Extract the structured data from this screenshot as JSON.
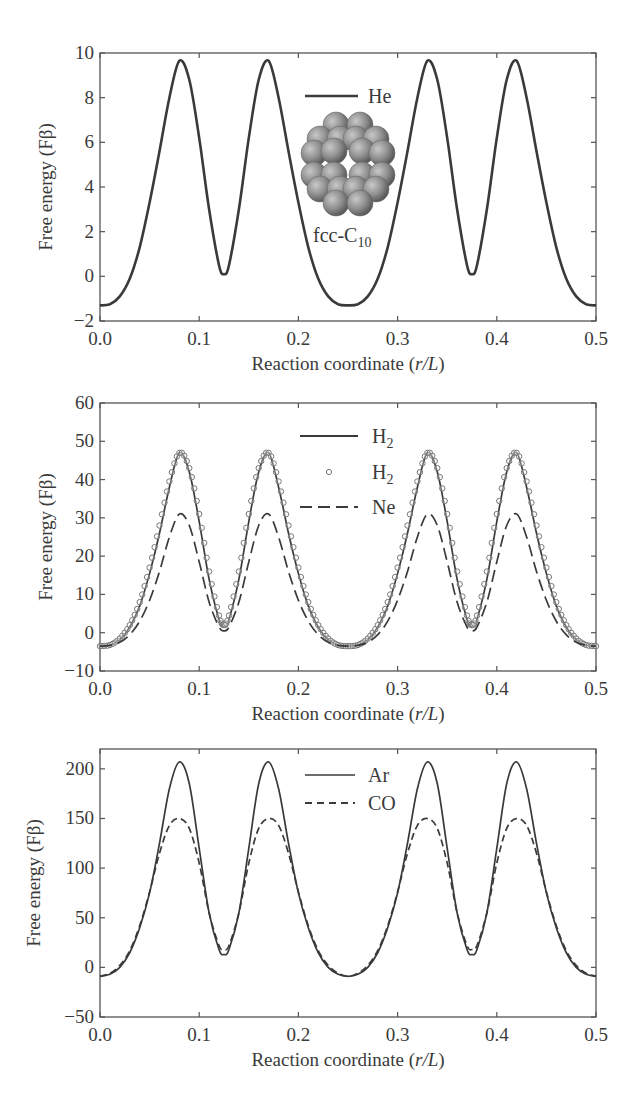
{
  "chart_data": [
    {
      "type": "line",
      "title": "",
      "xlabel": "Reaction coordinate (r/L)",
      "ylabel": "Free energy (Fβ)",
      "xlim": [
        0.0,
        0.5
      ],
      "ylim": [
        -2,
        10
      ],
      "xticks": [
        "0.0",
        "0.1",
        "0.2",
        "0.3",
        "0.4",
        "0.5"
      ],
      "yticks": [
        "−2",
        "0",
        "2",
        "4",
        "6",
        "8",
        "10"
      ],
      "ytick_values": [
        -2,
        0,
        2,
        4,
        6,
        8,
        10
      ],
      "grid": false,
      "legend_position": "upper center",
      "annotation": "fcc-C10",
      "inset": "fcc-C10 cluster molecular image",
      "x": [
        0.0,
        0.01,
        0.02,
        0.03,
        0.04,
        0.05,
        0.06,
        0.07,
        0.08,
        0.09,
        0.1,
        0.11,
        0.12,
        0.125,
        0.13,
        0.14,
        0.15,
        0.16,
        0.17,
        0.18,
        0.19,
        0.2,
        0.21,
        0.22,
        0.23,
        0.24,
        0.25,
        0.26,
        0.27,
        0.28,
        0.29,
        0.3,
        0.31,
        0.32,
        0.33,
        0.34,
        0.35,
        0.36,
        0.37,
        0.375,
        0.38,
        0.39,
        0.4,
        0.41,
        0.42,
        0.43,
        0.44,
        0.45,
        0.46,
        0.47,
        0.48,
        0.49,
        0.5
      ],
      "series": [
        {
          "name": "He",
          "style": "solid",
          "values": [
            -1.3,
            -1.25,
            -0.9,
            -0.1,
            1.3,
            3.3,
            5.6,
            8.0,
            9.65,
            8.8,
            6.2,
            3.0,
            0.5,
            0.1,
            0.5,
            3.0,
            6.2,
            8.8,
            9.65,
            8.0,
            5.6,
            3.3,
            1.3,
            -0.1,
            -0.9,
            -1.25,
            -1.3,
            -1.25,
            -0.9,
            -0.1,
            1.3,
            3.3,
            5.6,
            8.0,
            9.65,
            8.8,
            6.2,
            3.0,
            0.5,
            0.1,
            0.5,
            3.0,
            6.2,
            8.8,
            9.65,
            8.0,
            5.6,
            3.3,
            1.3,
            -0.1,
            -0.9,
            -1.25,
            -1.3
          ]
        }
      ]
    },
    {
      "type": "line",
      "title": "",
      "xlabel": "Reaction coordinate (r/L)",
      "ylabel": "Free energy (Fβ)",
      "xlim": [
        0.0,
        0.5
      ],
      "ylim": [
        -10,
        60
      ],
      "xticks": [
        "0.0",
        "0.1",
        "0.2",
        "0.3",
        "0.4",
        "0.5"
      ],
      "yticks": [
        "−10",
        "0",
        "10",
        "20",
        "30",
        "40",
        "50",
        "60"
      ],
      "ytick_values": [
        -10,
        0,
        10,
        20,
        30,
        40,
        50,
        60
      ],
      "grid": false,
      "legend_position": "upper center",
      "x": [
        0.0,
        0.01,
        0.02,
        0.03,
        0.04,
        0.05,
        0.06,
        0.07,
        0.08,
        0.09,
        0.1,
        0.11,
        0.12,
        0.125,
        0.13,
        0.14,
        0.15,
        0.16,
        0.17,
        0.18,
        0.19,
        0.2,
        0.21,
        0.22,
        0.23,
        0.24,
        0.25,
        0.26,
        0.27,
        0.28,
        0.29,
        0.3,
        0.31,
        0.32,
        0.33,
        0.34,
        0.35,
        0.36,
        0.37,
        0.375,
        0.38,
        0.39,
        0.4,
        0.41,
        0.42,
        0.43,
        0.44,
        0.45,
        0.46,
        0.47,
        0.48,
        0.49,
        0.5
      ],
      "series": [
        {
          "name": "H2",
          "label": "H₂",
          "style": "solid",
          "values": [
            -3.5,
            -3.2,
            -1.8,
            1.5,
            7.0,
            15.5,
            26.0,
            38.0,
            47.0,
            42.0,
            29.0,
            14.0,
            3.5,
            1.5,
            3.5,
            14.0,
            29.0,
            42.0,
            47.0,
            38.0,
            26.0,
            15.5,
            7.0,
            1.5,
            -1.8,
            -3.2,
            -3.5,
            -3.2,
            -1.8,
            1.5,
            7.0,
            15.5,
            26.0,
            38.0,
            47.0,
            42.0,
            29.0,
            14.0,
            3.5,
            1.5,
            3.5,
            14.0,
            29.0,
            42.0,
            47.0,
            38.0,
            26.0,
            15.5,
            7.0,
            1.5,
            -1.8,
            -3.2,
            -3.5
          ]
        },
        {
          "name": "H2 (circles)",
          "label": "H₂",
          "style": "circles",
          "values": [
            -3.5,
            -3.2,
            -1.5,
            2.0,
            8.0,
            17.0,
            28.0,
            39.5,
            47.0,
            43.0,
            31.0,
            16.0,
            4.5,
            2.0,
            4.5,
            16.0,
            31.0,
            43.0,
            47.0,
            39.5,
            28.0,
            17.0,
            8.0,
            2.0,
            -1.5,
            -3.2,
            -3.5,
            -3.2,
            -1.5,
            2.0,
            8.0,
            17.0,
            28.0,
            39.5,
            47.0,
            43.0,
            31.0,
            16.0,
            4.5,
            2.0,
            4.5,
            16.0,
            31.0,
            43.0,
            47.0,
            39.5,
            28.0,
            17.0,
            8.0,
            2.0,
            -1.5,
            -3.2,
            -3.5
          ]
        },
        {
          "name": "Ne",
          "label": "Ne",
          "style": "dashed",
          "values": [
            -3.5,
            -3.3,
            -2.5,
            -0.5,
            3.0,
            8.5,
            16.0,
            25.0,
            31.0,
            28.0,
            18.5,
            8.0,
            1.5,
            0.5,
            1.5,
            8.0,
            18.5,
            28.0,
            31.0,
            25.0,
            16.0,
            8.5,
            3.0,
            -0.5,
            -2.5,
            -3.3,
            -3.5,
            -3.3,
            -2.5,
            -0.5,
            3.0,
            8.5,
            16.0,
            25.0,
            31.0,
            28.0,
            18.5,
            8.0,
            1.5,
            0.5,
            1.5,
            8.0,
            18.5,
            28.0,
            31.0,
            25.0,
            16.0,
            8.5,
            3.0,
            -0.5,
            -2.5,
            -3.3,
            -3.5
          ]
        }
      ]
    },
    {
      "type": "line",
      "title": "",
      "xlabel": "Reaction coordinate (r/L)",
      "ylabel": "Free energy (Fβ)",
      "xlim": [
        0.0,
        0.5
      ],
      "ylim": [
        -50,
        220
      ],
      "xticks": [
        "0.0",
        "0.1",
        "0.2",
        "0.3",
        "0.4",
        "0.5"
      ],
      "yticks": [
        "−50",
        "0",
        "50",
        "100",
        "150",
        "200"
      ],
      "ytick_values": [
        -50,
        0,
        50,
        100,
        150,
        200
      ],
      "grid": false,
      "legend_position": "upper center",
      "x": [
        0.0,
        0.01,
        0.02,
        0.03,
        0.04,
        0.05,
        0.06,
        0.07,
        0.08,
        0.09,
        0.1,
        0.11,
        0.12,
        0.125,
        0.13,
        0.14,
        0.15,
        0.16,
        0.17,
        0.18,
        0.19,
        0.2,
        0.21,
        0.22,
        0.23,
        0.24,
        0.25,
        0.26,
        0.27,
        0.28,
        0.29,
        0.3,
        0.31,
        0.32,
        0.33,
        0.34,
        0.35,
        0.36,
        0.37,
        0.375,
        0.38,
        0.39,
        0.4,
        0.41,
        0.42,
        0.43,
        0.44,
        0.45,
        0.46,
        0.47,
        0.48,
        0.49,
        0.5
      ],
      "series": [
        {
          "name": "Ar",
          "label": "Ar",
          "style": "solid",
          "values": [
            -9,
            -7,
            0,
            15,
            40,
            75,
            125,
            180,
            207,
            185,
            120,
            55,
            18,
            13,
            18,
            55,
            120,
            185,
            207,
            180,
            125,
            75,
            40,
            15,
            0,
            -7,
            -9,
            -7,
            0,
            15,
            40,
            75,
            125,
            180,
            207,
            185,
            120,
            55,
            18,
            13,
            18,
            55,
            120,
            185,
            207,
            180,
            125,
            75,
            40,
            15,
            0,
            -7,
            -9
          ]
        },
        {
          "name": "CO",
          "label": "CO",
          "style": "dashed",
          "values": [
            -9,
            -6,
            2,
            17,
            42,
            76,
            115,
            143,
            150,
            140,
            105,
            55,
            22,
            18,
            22,
            55,
            105,
            140,
            150,
            143,
            115,
            76,
            42,
            17,
            2,
            -6,
            -9,
            -6,
            2,
            17,
            42,
            76,
            115,
            143,
            150,
            140,
            105,
            55,
            22,
            18,
            22,
            55,
            105,
            140,
            150,
            143,
            115,
            76,
            42,
            17,
            2,
            -6,
            -9
          ]
        }
      ]
    }
  ],
  "panels": [
    {
      "ylabel": "Free energy (Fβ)",
      "xlabel_main": "Reaction coordinate (",
      "xlabel_var": "r/L",
      "xlabel_end": ")",
      "legend": [
        {
          "text": "He",
          "sub": ""
        }
      ],
      "inset_label_main": "fcc-C",
      "inset_label_sub": "10"
    },
    {
      "ylabel": "Free energy (Fβ)",
      "xlabel_main": "Reaction coordinate (",
      "xlabel_var": "r/L",
      "xlabel_end": ")",
      "legend": [
        {
          "text": "H",
          "sub": "2"
        },
        {
          "text": "H",
          "sub": "2"
        },
        {
          "text": "Ne",
          "sub": ""
        }
      ]
    },
    {
      "ylabel": "Free energy (Fβ)",
      "xlabel_main": "Reaction coordinate (",
      "xlabel_var": "r/L",
      "xlabel_end": ")",
      "legend": [
        {
          "text": "Ar",
          "sub": ""
        },
        {
          "text": "CO",
          "sub": ""
        }
      ]
    }
  ],
  "colors": {
    "line": "#3a3a3a",
    "axis": "#555555",
    "marker": "#777777",
    "sphere": "#8a8a8a"
  }
}
